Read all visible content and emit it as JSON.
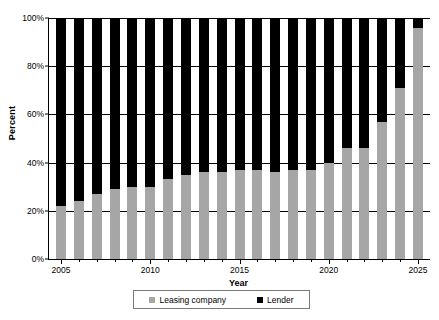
{
  "chart_data": {
    "type": "bar",
    "subtype": "stacked-100-percent",
    "title": "",
    "xlabel": "Year",
    "ylabel": "Percent",
    "ylim": [
      0,
      100
    ],
    "ytick_labels": [
      "0%",
      "20%",
      "40%",
      "60%",
      "80%",
      "100%"
    ],
    "ytick_values": [
      0,
      20,
      40,
      60,
      80,
      100
    ],
    "xtick_labels": [
      "2005",
      "2010",
      "2015",
      "2020",
      "2025"
    ],
    "xtick_values": [
      2005,
      2010,
      2015,
      2020,
      2025
    ],
    "grid": true,
    "legend_position": "bottom",
    "categories": [
      2005,
      2006,
      2007,
      2008,
      2009,
      2010,
      2011,
      2012,
      2013,
      2014,
      2015,
      2016,
      2017,
      2018,
      2019,
      2020,
      2021,
      2022,
      2023,
      2024,
      2025
    ],
    "series": [
      {
        "name": "Leasing company",
        "color": "#a6a6a6",
        "values": [
          22,
          24,
          27,
          29,
          30,
          30,
          33,
          35,
          36,
          36,
          37,
          37,
          36,
          37,
          37,
          40,
          46,
          46,
          57,
          71,
          96
        ]
      },
      {
        "name": "Lender",
        "color": "#000000",
        "values": [
          78,
          76,
          73,
          71,
          70,
          70,
          67,
          65,
          64,
          64,
          63,
          63,
          64,
          63,
          63,
          60,
          54,
          54,
          43,
          29,
          4
        ]
      }
    ]
  },
  "legend": {
    "items": [
      {
        "label": "Leasing company",
        "color": "#a6a6a6",
        "swatch": "square-gray-icon"
      },
      {
        "label": "Lender",
        "color": "#000000",
        "swatch": "square-black-icon"
      }
    ]
  }
}
